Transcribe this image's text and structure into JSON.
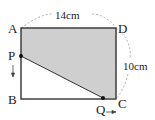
{
  "diagram": {
    "type": "geometry-rectangle-moving-points",
    "colors": {
      "stroke": "#333333",
      "shade": "#cfcfcf",
      "dashed_arc": "#999999",
      "background": "#ffffff"
    },
    "vertices": {
      "A": {
        "label": "A",
        "x": 21,
        "y": 28
      },
      "B": {
        "label": "B",
        "x": 21,
        "y": 99
      },
      "C": {
        "label": "C",
        "x": 116,
        "y": 99
      },
      "D": {
        "label": "D",
        "x": 116,
        "y": 28
      }
    },
    "points": {
      "P": {
        "label": "P",
        "x": 20,
        "y": 56,
        "on_side": "AB",
        "direction": "down"
      },
      "Q": {
        "label": "Q",
        "x": 103,
        "y": 98,
        "on_side": "BC",
        "direction": "right"
      }
    },
    "dimensions": {
      "AD": "14cm",
      "DC": "10cm"
    },
    "shaded_region": "APQCD"
  }
}
